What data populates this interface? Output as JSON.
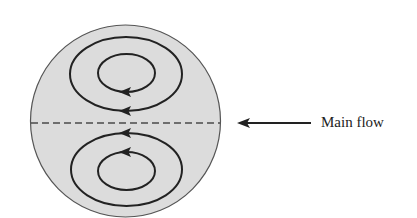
{
  "diagram": {
    "type": "flow-cross-section",
    "colors": {
      "background": "#ffffff",
      "disc_fill": "#dcdcdc",
      "stroke": "#222222",
      "disc_outline": "#555555",
      "centerline": "#4a4a4a"
    },
    "disc": {
      "cx": 125.5,
      "cy": 121,
      "rx": 95,
      "ry": 96
    },
    "centerline": {
      "x1": 31,
      "x2": 220,
      "y": 123,
      "style": "dashed"
    },
    "vortices": [
      {
        "name": "upper-outer",
        "cx": 126,
        "cy": 74,
        "rx": 56,
        "ry": 37,
        "arrow_at": "bottom",
        "arrow_direction": "left"
      },
      {
        "name": "upper-inner",
        "cx": 126.5,
        "cy": 73,
        "rx": 28.5,
        "ry": 19,
        "arrow_at": "bottom",
        "arrow_direction": "left"
      },
      {
        "name": "lower-outer",
        "cx": 126.5,
        "cy": 169.5,
        "rx": 55.5,
        "ry": 36.5,
        "arrow_at": "top",
        "arrow_direction": "left"
      },
      {
        "name": "lower-inner",
        "cx": 126.5,
        "cy": 171,
        "rx": 28.5,
        "ry": 19,
        "arrow_at": "top",
        "arrow_direction": "left"
      }
    ],
    "main_flow_arrow": {
      "x_from": 311,
      "x_to": 238,
      "y": 123,
      "direction": "left"
    },
    "labels": {
      "main_flow": "Main flow"
    }
  }
}
